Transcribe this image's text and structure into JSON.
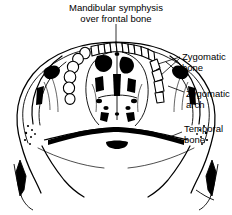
{
  "figure": {
    "kind": "anatomical-line-drawing",
    "view": "inferior (palatal) view of skull",
    "background_color": "#ffffff",
    "ink_color": "#000000"
  },
  "labels": {
    "mandibular_symphysis": "Mandibular symphysis\nover frontal bone",
    "zygomatic_bone": "Zygomatic\nbone",
    "zygomatic_arch": "Zygomatic\narch",
    "temporal_bone": "Temporal\nbone"
  },
  "caption": {
    "clipped_text": ""
  }
}
